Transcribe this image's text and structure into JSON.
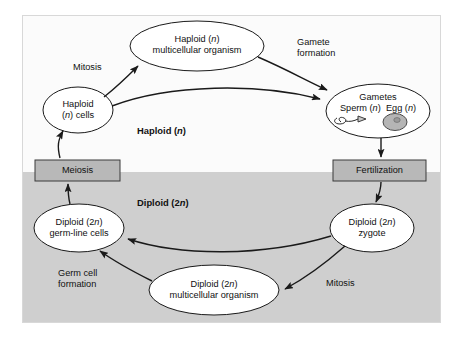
{
  "diagram": {
    "colors": {
      "haploid_zone_bg": "#fbfbfb",
      "diploid_zone_bg": "#cfcfcf",
      "box_fill": "#b8b8b8",
      "ellipse_fill": "#ffffff",
      "stroke": "#1a1a1a",
      "egg_fill": "#b5b5b5",
      "page_bg": "#ffffff"
    },
    "zones": [
      {
        "id": "haploid",
        "label_plain": "Haploid (n)",
        "label_main": "Haploid (",
        "label_italic": "n",
        "label_tail": ")"
      },
      {
        "id": "diploid",
        "label_plain": "Diploid (2n)",
        "label_main": "Diploid (2",
        "label_italic": "n",
        "label_tail": ")"
      }
    ],
    "nodes": [
      {
        "id": "haploid-multicellular-organism",
        "shape": "ellipse",
        "line1_main": "Haploid (",
        "line1_italic": "n",
        "line1_tail": ")",
        "line2": "multicellular organism",
        "plain": "Haploid (n) multicellular organism"
      },
      {
        "id": "haploid-cells",
        "shape": "ellipse",
        "line1": "Haploid",
        "line2_main": "(",
        "line2_italic": "n",
        "line2_tail": ") cells",
        "plain": "Haploid (n) cells"
      },
      {
        "id": "gametes",
        "shape": "ellipse",
        "line1": "Gametes",
        "line2_sperm_main": "Sperm (",
        "line2_sperm_italic": "n",
        "line2_sperm_tail": ")",
        "line2_egg_main": "Egg (",
        "line2_egg_italic": "n",
        "line2_egg_tail": ")",
        "plain": "Gametes Sperm (n) Egg (n)"
      },
      {
        "id": "diploid-zygote",
        "shape": "ellipse",
        "line1_main": "Diploid (2",
        "line1_italic": "n",
        "line1_tail": ")",
        "line2": "zygote",
        "plain": "Diploid (2n) zygote"
      },
      {
        "id": "diploid-multicellular-organism",
        "shape": "ellipse",
        "line1_main": "Diploid (2",
        "line1_italic": "n",
        "line1_tail": ")",
        "line2": "multicellular organism",
        "plain": "Diploid (2n) multicellular organism"
      },
      {
        "id": "diploid-germ-line-cells",
        "shape": "ellipse",
        "line1_main": "Diploid (2",
        "line1_italic": "n",
        "line1_tail": ")",
        "line2": "germ-line cells",
        "plain": "Diploid (2n) germ-line cells"
      },
      {
        "id": "meiosis-box",
        "shape": "rect",
        "label": "Meiosis"
      },
      {
        "id": "fertilization-box",
        "shape": "rect",
        "label": "Fertilization"
      }
    ],
    "edge_labels": [
      {
        "id": "mitosis-haploid",
        "line1": "Mitosis"
      },
      {
        "id": "gamete-formation",
        "line1": "Gamete",
        "line2": "formation"
      },
      {
        "id": "mitosis-diploid",
        "line1": "Mitosis"
      },
      {
        "id": "germ-cell-formation",
        "line1": "Germ cell",
        "line2": "formation"
      }
    ],
    "edges": [
      {
        "from": "haploid-cells",
        "to": "haploid-multicellular-organism",
        "label": "Mitosis"
      },
      {
        "from": "haploid-multicellular-organism",
        "to": "gametes",
        "label": "Gamete formation"
      },
      {
        "from": "haploid-cells",
        "to": "gametes",
        "label": ""
      },
      {
        "from": "gametes",
        "to": "fertilization-box",
        "label": ""
      },
      {
        "from": "fertilization-box",
        "to": "diploid-zygote",
        "label": ""
      },
      {
        "from": "diploid-zygote",
        "to": "diploid-germ-line-cells",
        "label": ""
      },
      {
        "from": "diploid-zygote",
        "to": "diploid-multicellular-organism",
        "label": "Mitosis"
      },
      {
        "from": "diploid-multicellular-organism",
        "to": "diploid-germ-line-cells",
        "label": "Germ cell formation"
      },
      {
        "from": "diploid-germ-line-cells",
        "to": "meiosis-box",
        "label": ""
      },
      {
        "from": "meiosis-box",
        "to": "haploid-cells",
        "label": ""
      }
    ]
  }
}
